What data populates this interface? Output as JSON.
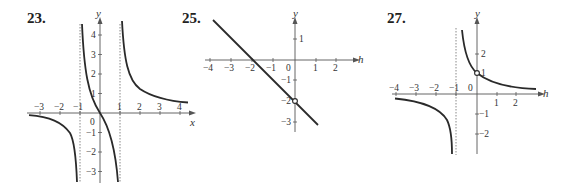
{
  "problems": [
    {
      "number": "23.",
      "x_axis_label": "x",
      "y_axis_label": "y",
      "x_ticks": [
        "-3",
        "-2",
        "-1",
        "1",
        "2",
        "3",
        "4"
      ],
      "y_ticks": [
        "4",
        "3",
        "2",
        "1",
        "-1",
        "-2",
        "-3"
      ],
      "origin_label": "0",
      "asymptotes": {
        "vertical": [
          -1,
          1
        ],
        "horizontal": [
          0
        ]
      }
    },
    {
      "number": "25.",
      "x_axis_label": "h",
      "y_axis_label": "y",
      "x_ticks": [
        "-4",
        "-3",
        "-2",
        "-1",
        "0",
        "1",
        "2"
      ],
      "y_ticks": [
        "1",
        "-1",
        "-2",
        "-3"
      ],
      "open_point": [
        0,
        -2
      ]
    },
    {
      "number": "27.",
      "x_axis_label": "h",
      "y_axis_label": "y",
      "x_ticks": [
        "-4",
        "-3",
        "-2",
        "-1",
        "1",
        "2"
      ],
      "y_ticks": [
        "2",
        "1",
        "-1",
        "-2"
      ],
      "origin_label": "0",
      "asymptotes": {
        "vertical": [
          -1
        ],
        "horizontal": [
          0
        ]
      },
      "open_point": [
        0,
        1
      ]
    }
  ],
  "colors": {
    "curve": "#2a2a2a",
    "axis": "#555555",
    "asymptote": "#888888"
  }
}
